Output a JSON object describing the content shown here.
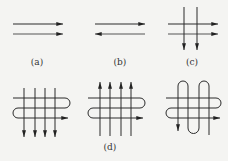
{
  "figure": {
    "panels": [
      {
        "id": "a",
        "label": "(a)",
        "description": "two parallel horizontal flows, both left-to-right"
      },
      {
        "id": "b",
        "label": "(b)",
        "description": "two parallel horizontal flows, opposite directions (top right, bottom left)"
      },
      {
        "id": "c",
        "label": "(c)",
        "description": "two horizontal flows left-to-right crossed by two vertical flows downward"
      },
      {
        "id": "d",
        "label": "(d)",
        "description": "serpentine horizontal flow crossed by four vertical flows: downward, upward, and serpentine vertical"
      }
    ],
    "colors": {
      "line": "#2a2a2a",
      "background": "#f4f4f2"
    }
  }
}
